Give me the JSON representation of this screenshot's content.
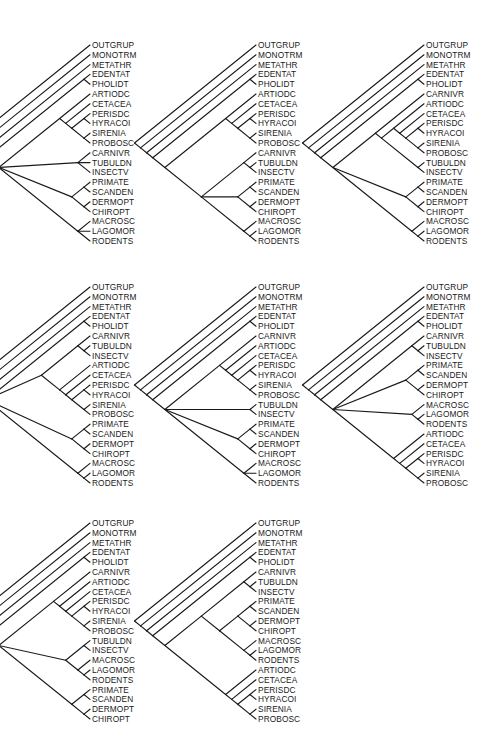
{
  "figure": {
    "trees": [
      {
        "id": "tree-1",
        "position": {
          "left": 30,
          "top": 41
        },
        "taxa": [
          "OUTGRUP",
          "MONOTRM",
          "METATHR",
          "EDENTAT",
          "PHOLIDT",
          "ARTIODC",
          "CETACEA",
          "PERISDC",
          "HYRACOI",
          "SIRENIA",
          "PROBOSC",
          "CARNIVR",
          "TUBULDN",
          "INSECTV",
          "PRIMATE",
          "SCANDEN",
          "DERMOPT",
          "CHIROPT",
          "MACROSC",
          "LAGOMOR",
          "RODENTS"
        ],
        "newick": "(OUTGRUP,(MONOTRM,(METATHR,((EDENTAT,PHOLIDT),((ARTIODC,(CETACEA,((PERISDC,HYRACOI),(SIRENIA,PROBOSC)))),(CARNIVR,TUBULDN,INSECTV),((PRIMATE,SCANDEN),(DERMOPT,CHIROPT)),(MACROSC,LAGOMOR,RODENTS))))))"
      },
      {
        "id": "tree-2",
        "position": {
          "left": 196,
          "top": 41
        },
        "taxa": [
          "OUTGRUP",
          "MONOTRM",
          "METATHR",
          "EDENTAT",
          "PHOLIDT",
          "ARTIODC",
          "CETACEA",
          "PERISDC",
          "HYRACOI",
          "SIRENIA",
          "PROBOSC",
          "CARNIVR",
          "TUBULDN",
          "INSECTV",
          "PRIMATE",
          "SCANDEN",
          "DERMOPT",
          "CHIROPT",
          "MACROSC",
          "LAGOMOR",
          "RODENTS"
        ],
        "newick": "(OUTGRUP,(MONOTRM,(METATHR,((EDENTAT,PHOLIDT),((ARTIODC,(CETACEA,((PERISDC,HYRACOI),(SIRENIA,PROBOSC)))),((CARNIVR,(TUBULDN,INSECTV)),((PRIMATE,SCANDEN),(DERMOPT,CHIROPT)),(MACROSC,(LAGOMOR,RODENTS))))))))"
      },
      {
        "id": "tree-3",
        "position": {
          "left": 364,
          "top": 41
        },
        "taxa": [
          "OUTGRUP",
          "MONOTRM",
          "METATHR",
          "EDENTAT",
          "PHOLIDT",
          "CARNIVR",
          "ARTIODC",
          "CETACEA",
          "PERISDC",
          "HYRACOI",
          "SIRENIA",
          "PROBOSC",
          "TUBULDN",
          "INSECTV",
          "PRIMATE",
          "SCANDEN",
          "DERMOPT",
          "CHIROPT",
          "MACROSC",
          "LAGOMOR",
          "RODENTS"
        ],
        "newick": "(OUTGRUP,(MONOTRM,(METATHR,((EDENTAT,PHOLIDT),((CARNIVR,((ARTIODC,(CETACEA,((PERISDC,HYRACOI),(SIRENIA,PROBOSC)))),(TUBULDN,INSECTV))),((PRIMATE,SCANDEN),(DERMOPT,CHIROPT)),(MACROSC,(LAGOMOR,RODENTS)))))))"
      },
      {
        "id": "tree-4",
        "position": {
          "left": 30,
          "top": 283
        },
        "taxa": [
          "OUTGRUP",
          "MONOTRM",
          "METATHR",
          "EDENTAT",
          "PHOLIDT",
          "CARNIVR",
          "TUBULDN",
          "INSECTV",
          "ARTIODC",
          "CETACEA",
          "PERISDC",
          "HYRACOI",
          "SIRENIA",
          "PROBOSC",
          "PRIMATE",
          "SCANDEN",
          "DERMOPT",
          "CHIROPT",
          "MACROSC",
          "LAGOMOR",
          "RODENTS"
        ],
        "newick": "(OUTGRUP,(MONOTRM,(METATHR,((EDENTAT,PHOLIDT),((CARNIVR,(TUBULDN,INSECTV)),(ARTIODC,(CETACEA,((PERISDC,HYRACOI),(SIRENIA,PROBOSC))))),((PRIMATE,SCANDEN),(DERMOPT,CHIROPT)),(MACROSC,(LAGOMOR,RODENTS))))))"
      },
      {
        "id": "tree-5",
        "position": {
          "left": 196,
          "top": 283
        },
        "taxa": [
          "OUTGRUP",
          "MONOTRM",
          "METATHR",
          "EDENTAT",
          "PHOLIDT",
          "CARNIVR",
          "ARTIODC",
          "CETACEA",
          "PERISDC",
          "HYRACOI",
          "SIRENIA",
          "PROBOSC",
          "TUBULDN",
          "INSECTV",
          "PRIMATE",
          "SCANDEN",
          "DERMOPT",
          "CHIROPT",
          "MACROSC",
          "LAGOMOR",
          "RODENTS"
        ],
        "newick": "(OUTGRUP,(MONOTRM,(METATHR,((EDENTAT,PHOLIDT),((CARNIVR,(ARTIODC,(CETACEA,((PERISDC,HYRACOI),(SIRENIA,PROBOSC))))),(TUBULDN,INSECTV),((PRIMATE,SCANDEN),(DERMOPT,CHIROPT)),(MACROSC,LAGOMOR,RODENTS))))))"
      },
      {
        "id": "tree-6",
        "position": {
          "left": 364,
          "top": 283
        },
        "taxa": [
          "OUTGRUP",
          "MONOTRM",
          "METATHR",
          "EDENTAT",
          "PHOLIDT",
          "CARNIVR",
          "TUBULDN",
          "INSECTV",
          "PRIMATE",
          "SCANDEN",
          "DERMOPT",
          "CHIROPT",
          "MACROSC",
          "LAGOMOR",
          "RODENTS",
          "ARTIODC",
          "CETACEA",
          "PERISDC",
          "HYRACOI",
          "SIRENIA",
          "PROBOSC"
        ],
        "newick": "(OUTGRUP,(MONOTRM,(METATHR,((EDENTAT,PHOLIDT),((CARNIVR,(TUBULDN,INSECTV)),((PRIMATE,SCANDEN),(DERMOPT,CHIROPT)),(MACROSC,(LAGOMOR,RODENTS)),(ARTIODC,(CETACEA,((PERISDC,HYRACOI),(SIRENIA,PROBOSC)))))))))"
      },
      {
        "id": "tree-7",
        "position": {
          "left": 30,
          "top": 519
        },
        "taxa": [
          "OUTGRUP",
          "MONOTRM",
          "METATHR",
          "EDENTAT",
          "PHOLIDT",
          "CARNIVR",
          "ARTIODC",
          "CETACEA",
          "PERISDC",
          "HYRACOI",
          "SIRENIA",
          "PROBOSC",
          "TUBULDN",
          "INSECTV",
          "MACROSC",
          "LAGOMOR",
          "RODENTS",
          "PRIMATE",
          "SCANDEN",
          "DERMOPT",
          "CHIROPT"
        ],
        "newick": "(OUTGRUP,(MONOTRM,(METATHR,((EDENTAT,PHOLIDT),((CARNIVR,(ARTIODC,(CETACEA,((PERISDC,HYRACOI),(SIRENIA,PROBOSC))))),((TUBULDN,INSECTV),(MACROSC,(LAGOMOR,RODENTS))),((PRIMATE,SCANDEN),(DERMOPT,CHIROPT)))))))"
      },
      {
        "id": "tree-8",
        "position": {
          "left": 196,
          "top": 519
        },
        "taxa": [
          "OUTGRUP",
          "MONOTRM",
          "METATHR",
          "EDENTAT",
          "PHOLIDT",
          "CARNIVR",
          "TUBULDN",
          "INSECTV",
          "PRIMATE",
          "SCANDEN",
          "DERMOPT",
          "CHIROPT",
          "MACROSC",
          "LAGOMOR",
          "RODENTS",
          "ARTIODC",
          "CETACEA",
          "PERISDC",
          "HYRACOI",
          "SIRENIA",
          "PROBOSC"
        ],
        "newick": "(OUTGRUP,(MONOTRM,(METATHR,((EDENTAT,PHOLIDT),(((CARNIVR,(TUBULDN,INSECTV)),(((PRIMATE,SCANDEN),(DERMOPT,CHIROPT)),(MACROSC,(LAGOMOR,RODENTS)))),(ARTIODC,(CETACEA,((PERISDC,HYRACOI),(SIRENIA,PROBOSC)))))))))"
      }
    ]
  },
  "style": {
    "line_color": "#1a1a1a",
    "text_color": "#1a1a1a",
    "background": "#ffffff",
    "row_pitch": 9.8,
    "label_x": 62
  }
}
